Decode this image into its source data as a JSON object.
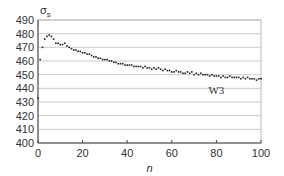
{
  "chart_data": {
    "type": "scatter",
    "title": "",
    "xlabel": "n",
    "ylabel": "σs",
    "ylabel_main": "σ",
    "ylabel_sub": "s",
    "xlim": [
      0,
      100
    ],
    "ylim": [
      400,
      490
    ],
    "xticks": [
      0,
      20,
      40,
      60,
      80,
      100
    ],
    "yticks": [
      400,
      410,
      420,
      430,
      440,
      450,
      460,
      470,
      480,
      490
    ],
    "grid": "horizontal",
    "legend": null,
    "annotations": [
      {
        "text": "W3",
        "x": 80,
        "y": 436
      }
    ],
    "series": [
      {
        "name": "W3",
        "x": [
          0,
          1,
          2,
          3,
          4,
          5,
          6,
          7,
          8,
          9,
          10,
          11,
          12,
          13,
          14,
          15,
          16,
          17,
          18,
          19,
          20,
          21,
          22,
          23,
          24,
          25,
          26,
          27,
          28,
          29,
          30,
          31,
          32,
          33,
          34,
          35,
          36,
          37,
          38,
          39,
          40,
          41,
          42,
          43,
          44,
          45,
          46,
          47,
          48,
          49,
          50,
          51,
          52,
          53,
          54,
          55,
          56,
          57,
          58,
          59,
          60,
          61,
          62,
          63,
          64,
          65,
          66,
          67,
          68,
          69,
          70,
          71,
          72,
          73,
          74,
          75,
          76,
          77,
          78,
          79,
          80,
          81,
          82,
          83,
          84,
          85,
          86,
          87,
          88,
          89,
          90,
          91,
          92,
          93,
          94,
          95,
          96,
          97,
          98,
          99,
          100
        ],
        "y": [
          433,
          461,
          470,
          476,
          478,
          479,
          478,
          476,
          473,
          473,
          472,
          472,
          473,
          471,
          470,
          469,
          468,
          468,
          467,
          467,
          466,
          466,
          465,
          465,
          464,
          463,
          463,
          462,
          462,
          461,
          461,
          461,
          460,
          460,
          459,
          459,
          458,
          458,
          458,
          457,
          457,
          457,
          457,
          456,
          456,
          456,
          456,
          455,
          456,
          455,
          455,
          454,
          455,
          454,
          455,
          454,
          453,
          454,
          453,
          453,
          452,
          452,
          453,
          452,
          452,
          451,
          451,
          452,
          451,
          452,
          450,
          451,
          450,
          451,
          450,
          450,
          450,
          449,
          450,
          449,
          449,
          449,
          448,
          449,
          448,
          448,
          449,
          448,
          448,
          448,
          448,
          447,
          448,
          447,
          448,
          447,
          447,
          447,
          446,
          447,
          447
        ]
      }
    ]
  },
  "colors": {
    "marker": "#222222",
    "grid": "#cccccc",
    "axis": "#444444",
    "frame": "#bbbbbb"
  }
}
